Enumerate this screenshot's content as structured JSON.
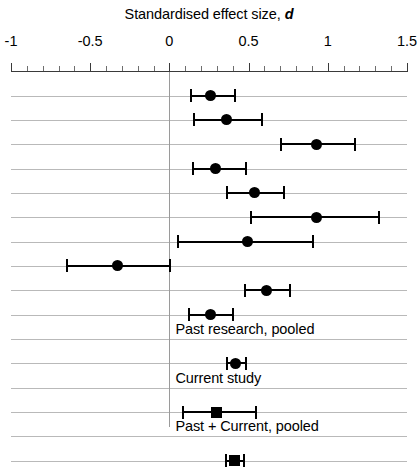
{
  "chart_data": {
    "type": "scatter",
    "chart_variant": "forest-plot",
    "title_text": "Standardised effect size,",
    "title_italic_symbol": "d",
    "xlabel": "Standardised effect size, d",
    "ylabel": "",
    "xlim": [
      -1,
      1.5
    ],
    "xticks": [
      -1,
      -0.5,
      0,
      0.5,
      1,
      1.5
    ],
    "xticklabels": [
      "-1",
      "-0.5",
      "0",
      "0.5",
      "1",
      "1.5"
    ],
    "minor_tick_step": 0.1,
    "grid": true,
    "grid_axis": "y",
    "reference_line": 0,
    "legend": "none",
    "marker_colors": {
      "point": "#000000",
      "ci": "#000000",
      "grid": "#b9b9b9",
      "reference": "#9a9a9a"
    },
    "rows": [
      {
        "index": 1,
        "label": "",
        "d": 0.26,
        "ci_low": 0.13,
        "ci_high": 0.42,
        "marker": "circle",
        "marker_size": 11
      },
      {
        "index": 2,
        "label": "",
        "d": 0.36,
        "ci_low": 0.15,
        "ci_high": 0.59,
        "marker": "circle",
        "marker_size": 11
      },
      {
        "index": 3,
        "label": "",
        "d": 0.93,
        "ci_low": 0.7,
        "ci_high": 1.18,
        "marker": "circle",
        "marker_size": 11
      },
      {
        "index": 4,
        "label": "",
        "d": 0.29,
        "ci_low": 0.14,
        "ci_high": 0.49,
        "marker": "circle",
        "marker_size": 11
      },
      {
        "index": 5,
        "label": "",
        "d": 0.54,
        "ci_low": 0.36,
        "ci_high": 0.73,
        "marker": "circle",
        "marker_size": 11
      },
      {
        "index": 6,
        "label": "",
        "d": 0.93,
        "ci_low": 0.51,
        "ci_high": 1.33,
        "marker": "circle",
        "marker_size": 11
      },
      {
        "index": 7,
        "label": "",
        "d": 0.49,
        "ci_low": 0.05,
        "ci_high": 0.91,
        "marker": "circle",
        "marker_size": 11
      },
      {
        "index": 8,
        "label": "",
        "d": -0.33,
        "ci_low": -0.65,
        "ci_high": 0.01,
        "marker": "circle",
        "marker_size": 11
      },
      {
        "index": 9,
        "label": "",
        "d": 0.61,
        "ci_low": 0.47,
        "ci_high": 0.77,
        "marker": "circle",
        "marker_size": 11
      },
      {
        "index": 10,
        "label": "",
        "d": 0.26,
        "ci_low": 0.12,
        "ci_high": 0.41,
        "marker": "circle",
        "marker_size": 11
      },
      {
        "index": 11,
        "label": "Past research, pooled",
        "d": null,
        "ci_low": null,
        "ci_high": null,
        "marker": "none",
        "marker_size": 0
      },
      {
        "index": 12,
        "label": "",
        "d": 0.42,
        "ci_low": 0.36,
        "ci_high": 0.49,
        "marker": "circle",
        "marker_size": 11
      },
      {
        "index": 13,
        "label": "Current study",
        "d": null,
        "ci_low": null,
        "ci_high": null,
        "marker": "none",
        "marker_size": 0
      },
      {
        "index": 14,
        "label": "",
        "d": 0.3,
        "ci_low": 0.08,
        "ci_high": 0.55,
        "marker": "square",
        "marker_size": 11
      },
      {
        "index": 15,
        "label": "Past + Current, pooled",
        "d": null,
        "ci_low": null,
        "ci_high": null,
        "marker": "none",
        "marker_size": 0
      },
      {
        "index": 16,
        "label": "",
        "d": 0.41,
        "ci_low": 0.35,
        "ci_high": 0.48,
        "marker": "square",
        "marker_size": 11
      }
    ],
    "group_labels": [
      "Past research, pooled",
      "Current study",
      "Past + Current, pooled"
    ]
  }
}
